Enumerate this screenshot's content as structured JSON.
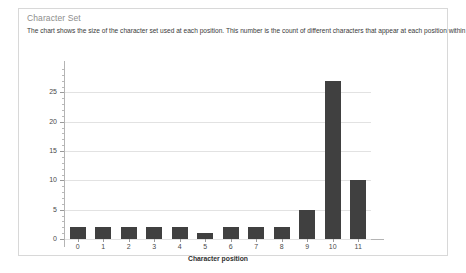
{
  "panel": {
    "title": "Character Set",
    "description": "The chart shows the size of the character set used at each position. This number is the count of different characters that appear at each position within the sample data."
  },
  "colors": {
    "bar": "#404040",
    "gridline": "#e2e2e2",
    "axis": "#b4b4b4",
    "panel_border": "#d8d8d8",
    "title_text": "#8d8d8d",
    "body_text": "#3a3a3a"
  },
  "chart_data": {
    "type": "bar",
    "title": "",
    "subtitle": "",
    "xlabel": "Character position",
    "ylabel": "",
    "categories": [
      "0",
      "1",
      "2",
      "3",
      "4",
      "5",
      "6",
      "7",
      "8",
      "9",
      "10",
      "11"
    ],
    "values": [
      2,
      2,
      2,
      2,
      2,
      1,
      2,
      2,
      2,
      5,
      27,
      10
    ],
    "ylim": [
      0,
      29
    ],
    "ytick_labels": [
      "0",
      "5",
      "10",
      "15",
      "20",
      "25"
    ],
    "ytick_values": [
      0,
      5,
      10,
      15,
      20,
      25
    ],
    "yminor_step": 1,
    "grid": true,
    "grid_axis": "y",
    "legend": false,
    "legend_position": "none",
    "bar_color": "#404040"
  }
}
